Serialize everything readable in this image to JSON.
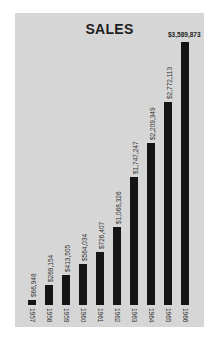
{
  "chart_data": {
    "type": "bar",
    "title": "SALES",
    "xlabel": "",
    "ylabel": "",
    "categories": [
      "1957",
      "1958",
      "1959",
      "1960",
      "1961",
      "1962",
      "1963",
      "1964",
      "1965",
      "1966"
    ],
    "values": [
      66948,
      269154,
      413505,
      564034,
      726407,
      1068326,
      1747247,
      2209349,
      2772113,
      3589873
    ],
    "value_labels": [
      "$66,948",
      "$269,154",
      "$413,505",
      "$564,034",
      "$726,407",
      "$1,068,326",
      "$1,747,247",
      "$2,209,349",
      "$2,772,113",
      "$3,589,873"
    ],
    "ylim": [
      0,
      3589873
    ],
    "grid": false,
    "legend": null
  },
  "colors": {
    "background": "#d6d6d6",
    "bar": "#151515",
    "title": "#1e1e1e"
  }
}
